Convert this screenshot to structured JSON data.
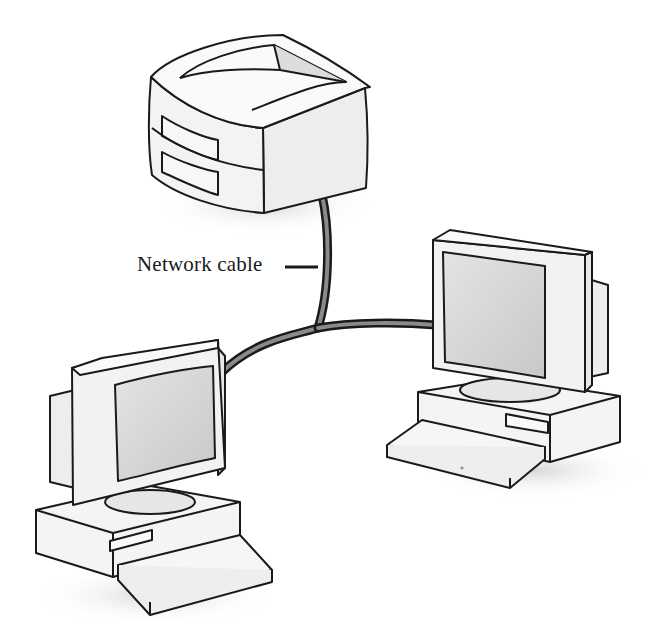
{
  "diagram": {
    "labels": {
      "cable": "Network cable"
    },
    "nodes": [
      {
        "id": "server",
        "kind": "server-icon"
      },
      {
        "id": "workstation-left",
        "kind": "desktop-computer-icon"
      },
      {
        "id": "workstation-right",
        "kind": "desktop-computer-icon"
      }
    ],
    "edges": [
      {
        "from": "server",
        "to": "junction"
      },
      {
        "from": "junction",
        "to": "workstation-left"
      },
      {
        "from": "junction",
        "to": "workstation-right"
      }
    ],
    "colors": {
      "outline": "#1a1a1a",
      "fill_light": "#f4f4f4",
      "fill_mid": "#e2e2e2",
      "screen": "#d6d6d6",
      "cable": "#3a3a3a",
      "cable_highlight": "#9a9a9a",
      "shadow": "#e6e6e6"
    }
  }
}
